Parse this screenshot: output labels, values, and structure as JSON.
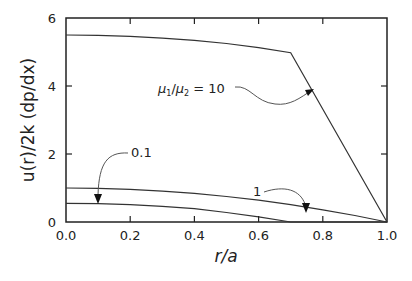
{
  "chart_data": {
    "type": "line",
    "title": "",
    "xlabel": "r/a",
    "ylabel": "u(r)/2k (dp/dx)",
    "xlim": [
      0.0,
      1.0
    ],
    "ylim": [
      0,
      6
    ],
    "grid": false,
    "x_ticks": [
      "0.0",
      "0.2",
      "0.4",
      "0.6",
      "0.8",
      "1.0"
    ],
    "y_ticks": [
      "0",
      "2",
      "4",
      "6"
    ],
    "series": [
      {
        "name": "μ1/μ2 = 10",
        "x": [
          0.0,
          0.1,
          0.2,
          0.3,
          0.4,
          0.5,
          0.6,
          0.7,
          1.0
        ],
        "values": [
          5.5,
          5.49,
          5.46,
          5.41,
          5.34,
          5.25,
          5.13,
          4.98,
          0.0
        ]
      },
      {
        "name": "1",
        "x": [
          0.0,
          0.1,
          0.2,
          0.3,
          0.4,
          0.5,
          0.6,
          0.7,
          0.8,
          0.9,
          1.0
        ],
        "values": [
          1.0,
          0.99,
          0.96,
          0.91,
          0.84,
          0.75,
          0.64,
          0.51,
          0.36,
          0.19,
          0.0
        ]
      },
      {
        "name": "0.1",
        "x": [
          0.0,
          0.1,
          0.2,
          0.3,
          0.4,
          0.5,
          0.6,
          0.7,
          0.8,
          0.9,
          1.0
        ],
        "values": [
          0.55,
          0.54,
          0.51,
          0.46,
          0.39,
          0.28,
          0.15,
          0.0,
          0.0,
          0.0,
          0.0
        ]
      }
    ],
    "annotations": [
      {
        "text": "μ1/μ2 = 10",
        "points_to_x": 0.79,
        "points_to_y": 3.8
      },
      {
        "text": "1",
        "points_to_x": 0.76,
        "points_to_y": 0.42
      },
      {
        "text": "0.1",
        "points_to_x": 0.1,
        "points_to_y": 0.54
      }
    ]
  },
  "labels": {
    "xlabel": "r/a",
    "ylabel": "u(r)/2k (dp/dx)",
    "annot_mu_ratio": "μ",
    "annot_sub1": "1",
    "annot_slash": "/",
    "annot_sub2": "2",
    "annot_eq": " = 10",
    "annot_one": "1",
    "annot_pointone": "0.1"
  }
}
